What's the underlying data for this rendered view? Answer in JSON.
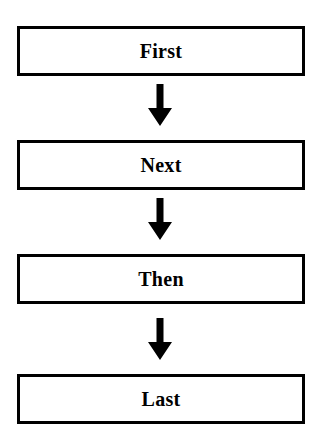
{
  "diagram": {
    "type": "flowchart",
    "orientation": "vertical",
    "background_color": "#ffffff",
    "ink_color": "#000000",
    "nodes": [
      {
        "id": "node-1",
        "label": "First",
        "shape": "rectangle",
        "border_color": "#000000",
        "fill_color": "#ffffff"
      },
      {
        "id": "node-2",
        "label": "Next",
        "shape": "rectangle",
        "border_color": "#000000",
        "fill_color": "#ffffff"
      },
      {
        "id": "node-3",
        "label": "Then",
        "shape": "rectangle",
        "border_color": "#000000",
        "fill_color": "#ffffff"
      },
      {
        "id": "node-4",
        "label": "Last",
        "shape": "rectangle",
        "border_color": "#000000",
        "fill_color": "#ffffff"
      }
    ],
    "connectors": [
      {
        "id": "arrow-1",
        "icon": "arrow-down-icon",
        "from": "node-1",
        "to": "node-2",
        "direction": "down",
        "color": "#000000"
      },
      {
        "id": "arrow-2",
        "icon": "arrow-down-icon",
        "from": "node-2",
        "to": "node-3",
        "direction": "down",
        "color": "#000000"
      },
      {
        "id": "arrow-3",
        "icon": "arrow-down-icon",
        "from": "node-3",
        "to": "node-4",
        "direction": "down",
        "color": "#000000"
      }
    ]
  }
}
